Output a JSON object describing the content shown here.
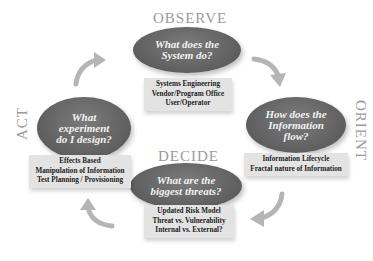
{
  "diagram": {
    "phases": {
      "observe": {
        "label": "OBSERVE",
        "question": "What does the System do?",
        "question_lines": [
          "What does the",
          "System do?"
        ],
        "items": [
          "Systems Engineering",
          "Vendor/Program Office",
          "User/Operator"
        ]
      },
      "orient": {
        "label": "ORIENT",
        "question": "How does the Information flow?",
        "question_lines": [
          "How does the",
          "Information",
          "flow?"
        ],
        "items": [
          "Information Lifecycle",
          "Fractal nature of Information"
        ]
      },
      "decide": {
        "label": "DECIDE",
        "question": "What are the biggest threats?",
        "question_lines": [
          "What are the",
          "biggest threats?"
        ],
        "items": [
          "Updated Risk Model",
          "Threat vs. Vulnerability",
          "Internal vs. External?"
        ]
      },
      "act": {
        "label": "ACT",
        "question": "What experiment do I design?",
        "question_lines": [
          "What",
          "experiment",
          "do I design?"
        ],
        "items": [
          "Effects Based",
          "Manipulation of Information",
          "Test Planning / Provisioning"
        ]
      }
    },
    "colors": {
      "ellipse": "#626262",
      "label_box": "#e3e3e3",
      "phase_text": "#9a9a9a",
      "arrow": "#b5b5b5"
    }
  }
}
